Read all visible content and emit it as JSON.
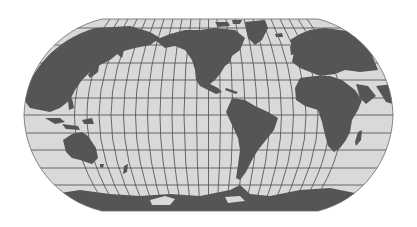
{
  "map": {
    "projection": "Robinson-like pseudocylindrical world map",
    "center_meridian": "Americas-centered (approx 90°W... Pacific at left)",
    "colors": {
      "background": "#ffffff",
      "ocean": "#d9d9d9",
      "land": "#555555",
      "graticule": "#4a4a4a",
      "outline": "#6a6a6a"
    },
    "graticule": {
      "meridian_count": 24,
      "parallel_count": 11
    },
    "regions_visible": [
      "Asia",
      "Europe",
      "Africa",
      "North America",
      "South America",
      "Australia",
      "Antarctica",
      "Greenland",
      "Madagascar",
      "New Zealand",
      "Japan",
      "Indonesia"
    ]
  }
}
